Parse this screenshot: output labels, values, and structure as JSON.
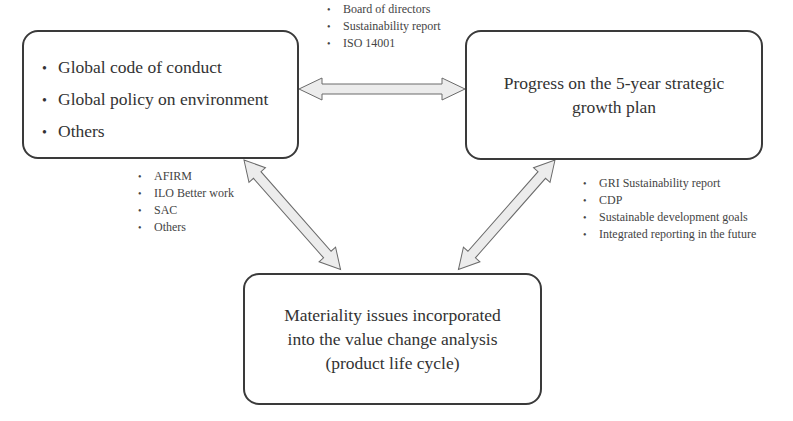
{
  "boxes": {
    "left": {
      "items": [
        "Global code of conduct",
        "Global policy on environment",
        "Others"
      ]
    },
    "right": {
      "lines": [
        "Progress on the 5-year strategic",
        "growth plan"
      ]
    },
    "bottom": {
      "lines": [
        "Materiality issues incorporated",
        "into the value change analysis",
        "(product life cycle)"
      ]
    }
  },
  "connectors": {
    "top": {
      "labels": [
        "Board of directors",
        "Sustainability report",
        "ISO 14001"
      ]
    },
    "left": {
      "labels": [
        "AFIRM",
        "ILO Better work",
        "SAC",
        "Others"
      ]
    },
    "right": {
      "labels": [
        "GRI Sustainability report",
        "CDP",
        "Sustainable development goals",
        "Integrated reporting in the future"
      ]
    }
  },
  "bullet": "•",
  "colors": {
    "border": "#3a3a3a",
    "arrow_fill": "#ececec",
    "arrow_stroke": "#6a6a6a",
    "text": "#333333"
  }
}
